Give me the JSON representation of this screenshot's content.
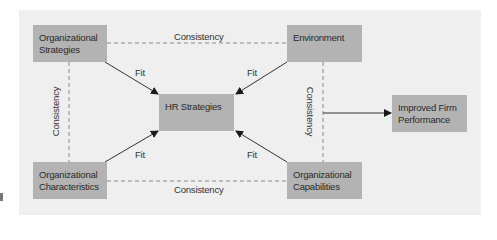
{
  "diagram": {
    "nodes": {
      "org_strategies": {
        "line1": "Organizational",
        "line2": "Strategies"
      },
      "environment": {
        "line1": "Environment",
        "line2": ""
      },
      "hr_strategies": {
        "line1": "HR Strategies",
        "line2": ""
      },
      "improved_performance": {
        "line1": "Improved Firm",
        "line2": "Performance"
      },
      "org_characteristics": {
        "line1": "Organizational",
        "line2": "Characteristics"
      },
      "org_capabilities": {
        "line1": "Organizational",
        "line2": "Capabilities"
      }
    },
    "edges": {
      "top_consistency": "Consistency",
      "bottom_consistency": "Consistency",
      "left_consistency": "Consistency",
      "right_consistency": "Consistency",
      "fit_top_left": "Fit",
      "fit_top_right": "Fit",
      "fit_bottom_left": "Fit",
      "fit_bottom_right": "Fit"
    },
    "colors": {
      "panel": "#efefef",
      "box": "#b3b3b3",
      "line": "#333333",
      "dashed": "#8a8a8a"
    }
  }
}
